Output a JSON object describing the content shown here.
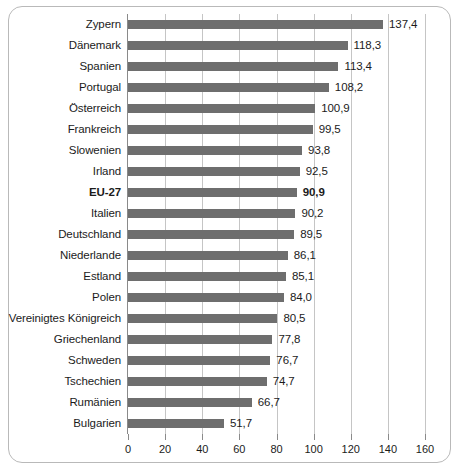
{
  "chart_data": {
    "type": "bar",
    "orientation": "horizontal",
    "title": "",
    "subtitle": "",
    "xlabel": "",
    "ylabel": "",
    "xlim": [
      0,
      160
    ],
    "xticks": [
      0,
      20,
      40,
      60,
      80,
      100,
      120,
      140,
      160
    ],
    "xtick_labels": [
      "0",
      "20",
      "40",
      "60",
      "80",
      "100",
      "120",
      "140",
      "160"
    ],
    "grid": "vertical",
    "legend": "none",
    "decimal_separator": ",",
    "bar_color": "#6e6e6e",
    "highlight_category": "EU-27",
    "categories": [
      "Zypern",
      "Dänemark",
      "Spanien",
      "Portugal",
      "Österreich",
      "Frankreich",
      "Slowenien",
      "Irland",
      "EU-27",
      "Italien",
      "Deutschland",
      "Niederlande",
      "Estland",
      "Polen",
      "Vereinigtes Königreich",
      "Griechenland",
      "Schweden",
      "Tschechien",
      "Rumänien",
      "Bulgarien"
    ],
    "values": [
      137.4,
      118.3,
      113.4,
      108.2,
      100.9,
      99.5,
      93.8,
      92.5,
      90.9,
      90.2,
      89.5,
      86.1,
      85.1,
      84.0,
      80.5,
      77.8,
      76.7,
      74.7,
      66.7,
      51.7
    ],
    "value_labels": [
      "137,4",
      "118,3",
      "113,4",
      "108,2",
      "100,9",
      "99,5",
      "93,8",
      "92,5",
      "90,9",
      "90,2",
      "89,5",
      "86,1",
      "85,1",
      "84,0",
      "80,5",
      "77,8",
      "76,7",
      "74,7",
      "66,7",
      "51,7"
    ]
  }
}
